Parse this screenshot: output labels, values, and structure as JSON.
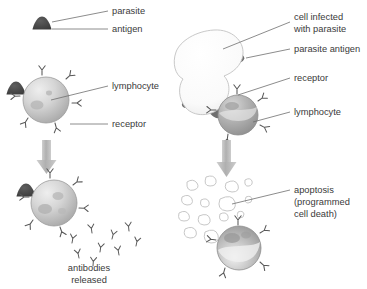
{
  "diagram": {
    "background_color": "#ffffff",
    "text_color": "#3a3a3a",
    "leader_line_color": "#6e6e6e",
    "arrow_color": "#b3b3b3",
    "antigen_color": "#4a4a4a",
    "lymphocyte_color": "#c9c9c9",
    "infected_cell_color": "#fbfbfb",
    "fragment_color": "#c4c4c4",
    "antibody_color": "#5a5a5a"
  },
  "left_panel": {
    "name": "humoral-response",
    "labels": {
      "parasite": "parasite",
      "antigen": "antigen",
      "lymphocyte": "lymphocyte",
      "receptor": "receptor"
    },
    "outcome": {
      "line1": "antibodies",
      "line2": "released"
    },
    "antibody_count": 9,
    "receptor_count_top": 5,
    "receptor_count_bottom": 5
  },
  "right_panel": {
    "name": "cell-mediated-response",
    "labels": {
      "infected_cell_line1": "cell infected",
      "infected_cell_line2": "with parasite",
      "parasite_antigen": "parasite antigen",
      "receptor": "receptor",
      "lymphocyte": "lymphocyte"
    },
    "outcome": {
      "line1": "apoptosis",
      "line2": "(programmed",
      "line3": "cell death)"
    },
    "antigen_count": 4,
    "fragment_count": 14,
    "receptor_count_top": 4,
    "receptor_count_bottom": 4
  }
}
